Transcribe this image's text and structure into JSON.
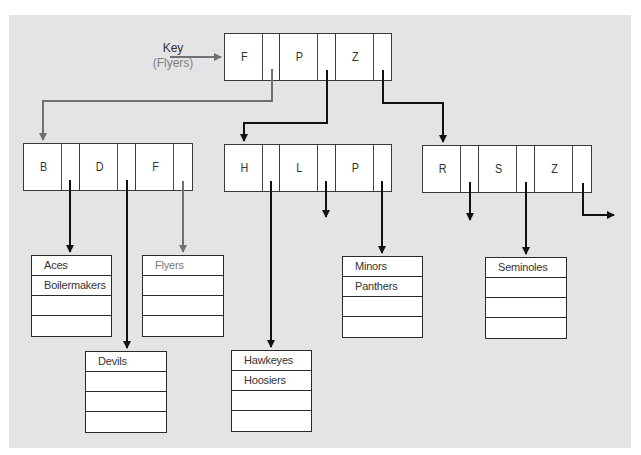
{
  "diagram": {
    "type": "B-tree index search",
    "key_label": {
      "title": "Key",
      "value": "(Flyers)"
    },
    "root_node": {
      "keys": [
        "F",
        "P",
        "Z"
      ]
    },
    "internal_nodes": [
      {
        "id": "left",
        "keys": [
          "B",
          "D",
          "F"
        ]
      },
      {
        "id": "middle",
        "keys": [
          "H",
          "L",
          "P"
        ]
      },
      {
        "id": "right",
        "keys": [
          "R",
          "S",
          "Z"
        ]
      }
    ],
    "leaf_blocks": [
      {
        "id": "aces",
        "rows": [
          "Aces",
          "Boilermakers",
          "",
          ""
        ]
      },
      {
        "id": "flyers",
        "rows": [
          "Flyers",
          "",
          "",
          ""
        ],
        "highlighted": true
      },
      {
        "id": "devils",
        "rows": [
          "Devils",
          "",
          "",
          ""
        ]
      },
      {
        "id": "hawkeyes",
        "rows": [
          "Hawkeyes",
          "Hoosiers",
          "",
          ""
        ]
      },
      {
        "id": "minors",
        "rows": [
          "Minors",
          "Panthers",
          "",
          ""
        ]
      },
      {
        "id": "seminoles",
        "rows": [
          "Seminoles",
          "",
          "",
          ""
        ]
      }
    ],
    "colors": {
      "background": "#e4e4e4",
      "node_fill": "#ffffff",
      "border": "#3a3a3a",
      "pointer_arrow": "#111111",
      "search_path_arrow": "#707070",
      "search_path_text": "#808080"
    }
  }
}
